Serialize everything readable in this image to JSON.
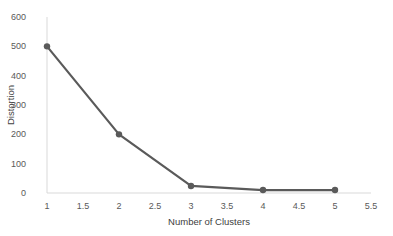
{
  "chart_data": {
    "type": "line",
    "title": "",
    "xlabel": "Number of Clusters",
    "ylabel": "Distortion",
    "x": [
      1,
      2,
      3,
      4,
      5
    ],
    "series": [
      {
        "name": "Distortion",
        "values": [
          500,
          200,
          24,
          10,
          10
        ],
        "color": "#5a5a5a",
        "markers": true
      }
    ],
    "xlim": [
      1,
      5.5
    ],
    "ylim": [
      0,
      600
    ],
    "xticks": [
      "1",
      "1.5",
      "2",
      "2.5",
      "3",
      "3.5",
      "4",
      "4.5",
      "5",
      "5.5"
    ],
    "yticks": [
      "0",
      "100",
      "200",
      "300",
      "400",
      "500",
      "600"
    ],
    "grid": false,
    "legend": null
  },
  "colors": {
    "line": "#5a5a5a",
    "axis": "#d9d9d9",
    "text": "#595959",
    "background": "#ffffff"
  }
}
